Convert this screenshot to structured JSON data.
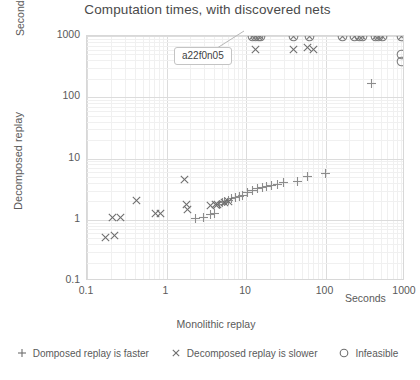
{
  "chart_data": {
    "type": "scatter",
    "title": "Computation times, with discovered nets",
    "xlabel": "Monolithic replay",
    "ylabel": "Decomposed replay",
    "x_unit_label": "Seconds",
    "y_unit_label": "Seconds",
    "xscale": "log",
    "yscale": "log",
    "xlim": [
      0.1,
      1000
    ],
    "ylim": [
      0.1,
      1000
    ],
    "xticks": [
      "0.1",
      "1",
      "10",
      "100",
      "1000"
    ],
    "yticks": [
      "1000",
      "100",
      "10",
      "1",
      "0.1"
    ],
    "grid": true,
    "legend_position": "bottom",
    "annotation": {
      "text": "a22f0n05",
      "points_to_x": 13,
      "points_to_y": 1000
    },
    "series": [
      {
        "name": "Domposed replay is faster",
        "marker": "plus",
        "color": "#8c8c8c",
        "points": [
          [
            2.3,
            1.05
          ],
          [
            2.9,
            1.1
          ],
          [
            3.6,
            1.2
          ],
          [
            4.0,
            1.25
          ],
          [
            4.6,
            1.8
          ],
          [
            5.0,
            1.9
          ],
          [
            5.4,
            2.0
          ],
          [
            6.0,
            2.1
          ],
          [
            6.6,
            2.2
          ],
          [
            7.4,
            2.3
          ],
          [
            8.2,
            2.4
          ],
          [
            9.0,
            2.5
          ],
          [
            10.5,
            2.8
          ],
          [
            12.0,
            3.0
          ],
          [
            14.0,
            3.2
          ],
          [
            16.0,
            3.4
          ],
          [
            18.0,
            3.5
          ],
          [
            21.0,
            3.6
          ],
          [
            25.0,
            3.7
          ],
          [
            30.0,
            4.0
          ],
          [
            44.0,
            4.3
          ],
          [
            60.0,
            5.0
          ],
          [
            100.0,
            5.8
          ],
          [
            380.0,
            170.0
          ]
        ]
      },
      {
        "name": "Decomposed replay is slower",
        "marker": "cross",
        "color": "#6e6e6e",
        "points": [
          [
            0.17,
            0.52
          ],
          [
            0.22,
            0.56
          ],
          [
            0.21,
            1.08
          ],
          [
            0.26,
            1.1
          ],
          [
            0.42,
            2.1
          ],
          [
            0.72,
            1.25
          ],
          [
            0.85,
            1.25
          ],
          [
            1.7,
            4.5
          ],
          [
            1.8,
            1.75
          ],
          [
            1.85,
            1.45
          ],
          [
            3.6,
            1.7
          ],
          [
            4.1,
            1.75
          ],
          [
            4.4,
            1.8
          ],
          [
            5.4,
            1.9
          ],
          [
            6.0,
            2.0
          ],
          [
            13.0,
            600.0
          ],
          [
            40.0,
            600.0
          ],
          [
            60.0,
            640.0
          ],
          [
            70.0,
            600.0
          ]
        ]
      },
      {
        "name": "Infeasible",
        "marker": "circle",
        "color": "#808080",
        "points": [
          [
            900.0,
            500.0
          ],
          [
            900.0,
            380.0
          ]
        ]
      },
      {
        "name": "Infeasible and slower (overlapping, top edge)",
        "marker": "circle-cross",
        "color": "#7a7a7a",
        "points": [
          [
            12.0,
            1000
          ],
          [
            13.0,
            1000
          ],
          [
            14.2,
            1000
          ],
          [
            15.4,
            1000
          ],
          [
            40.0,
            1000
          ],
          [
            62.0,
            1000
          ],
          [
            165.0,
            1000
          ],
          [
            230.0,
            1000
          ],
          [
            270.0,
            1000
          ],
          [
            290.0,
            1000
          ],
          [
            430.0,
            1000
          ],
          [
            470.0,
            1000
          ],
          [
            520.0,
            1000
          ],
          [
            900.0,
            1000
          ]
        ]
      }
    ],
    "legend": [
      {
        "glyph": "plus-icon",
        "label": "Domposed replay is faster"
      },
      {
        "glyph": "cross-icon",
        "label": "Decomposed replay is slower"
      },
      {
        "glyph": "circle-icon",
        "label": "Infeasible"
      }
    ]
  }
}
